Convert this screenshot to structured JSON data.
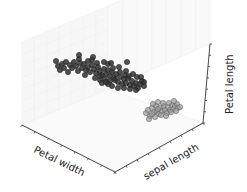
{
  "chart_data": {
    "type": "scatter",
    "projection": "3d",
    "title": "",
    "axes": {
      "x": {
        "label": "Petal width",
        "ticks_visible": true,
        "tick_labels": []
      },
      "y": {
        "label": "sepal length",
        "ticks_visible": true,
        "tick_labels": []
      },
      "z": {
        "label": "Petal length",
        "ticks_visible": true,
        "tick_labels": []
      }
    },
    "grid": true,
    "legend": null,
    "series": [
      {
        "name": "cluster-dark",
        "color": "#333333",
        "edge_color": "#222222",
        "alpha": 0.85,
        "count_estimate": 100,
        "screen_points": [
          [
            56,
            61
          ],
          [
            58,
            66
          ],
          [
            62,
            64
          ],
          [
            60,
            70
          ],
          [
            66,
            62
          ],
          [
            64,
            68
          ],
          [
            70,
            65
          ],
          [
            68,
            72
          ],
          [
            74,
            62
          ],
          [
            72,
            68
          ],
          [
            76,
            66
          ],
          [
            78,
            71
          ],
          [
            80,
            63
          ],
          [
            82,
            68
          ],
          [
            79,
            59
          ],
          [
            84,
            64
          ],
          [
            86,
            70
          ],
          [
            88,
            67
          ],
          [
            90,
            72
          ],
          [
            92,
            65
          ],
          [
            94,
            69
          ],
          [
            96,
            73
          ],
          [
            98,
            67
          ],
          [
            100,
            71
          ],
          [
            102,
            75
          ],
          [
            104,
            69
          ],
          [
            106,
            74
          ],
          [
            108,
            70
          ],
          [
            110,
            76
          ],
          [
            112,
            72
          ],
          [
            114,
            78
          ],
          [
            104,
            62
          ],
          [
            108,
            64
          ],
          [
            97,
            63
          ],
          [
            100,
            80
          ],
          [
            105,
            79
          ],
          [
            110,
            81
          ],
          [
            115,
            80
          ],
          [
            118,
            82
          ],
          [
            120,
            77
          ],
          [
            122,
            84
          ],
          [
            124,
            79
          ],
          [
            126,
            83
          ],
          [
            128,
            78
          ],
          [
            130,
            85
          ],
          [
            132,
            81
          ],
          [
            134,
            86
          ],
          [
            136,
            83
          ],
          [
            138,
            88
          ],
          [
            140,
            84
          ],
          [
            142,
            81
          ],
          [
            120,
            72
          ],
          [
            125,
            75
          ],
          [
            116,
            74
          ],
          [
            129,
            76
          ],
          [
            133,
            74
          ],
          [
            137,
            77
          ],
          [
            141,
            77
          ],
          [
            144,
            82
          ],
          [
            126,
            71
          ],
          [
            88,
            61
          ],
          [
            92,
            60
          ],
          [
            85,
            75
          ],
          [
            95,
            78
          ],
          [
            102,
            83
          ],
          [
            108,
            84
          ],
          [
            112,
            86
          ],
          [
            118,
            88
          ],
          [
            124,
            88
          ],
          [
            130,
            89
          ],
          [
            136,
            90
          ],
          [
            144,
            86
          ],
          [
            127,
            62
          ],
          [
            79,
            55
          ],
          [
            93,
            57
          ],
          [
            113,
            68
          ],
          [
            119,
            67
          ],
          [
            111,
            63
          ],
          [
            106,
            82
          ],
          [
            100,
            76
          ]
        ]
      },
      {
        "name": "cluster-light",
        "color": "#9a9a9a",
        "edge_color": "#666666",
        "alpha": 0.7,
        "count_estimate": 50,
        "screen_points": [
          [
            146,
            113
          ],
          [
            148,
            110
          ],
          [
            150,
            116
          ],
          [
            152,
            108
          ],
          [
            154,
            112
          ],
          [
            156,
            106
          ],
          [
            157,
            111
          ],
          [
            159,
            114
          ],
          [
            160,
            108
          ],
          [
            162,
            111
          ],
          [
            164,
            106
          ],
          [
            165,
            110
          ],
          [
            167,
            113
          ],
          [
            168,
            107
          ],
          [
            170,
            110
          ],
          [
            172,
            105
          ],
          [
            173,
            109
          ],
          [
            175,
            106
          ],
          [
            177,
            104
          ],
          [
            178,
            108
          ],
          [
            180,
            107
          ],
          [
            153,
            104
          ],
          [
            158,
            102
          ],
          [
            163,
            103
          ],
          [
            169,
            103
          ],
          [
            174,
            101
          ],
          [
            149,
            119
          ],
          [
            155,
            117
          ],
          [
            161,
            115
          ],
          [
            166,
            116
          ],
          [
            171,
            112
          ],
          [
            176,
            111
          ],
          [
            152,
            114
          ],
          [
            158,
            109
          ]
        ]
      }
    ]
  },
  "axis_labels": {
    "x": "Petal width",
    "y": "sepal length",
    "z": "Petal length"
  }
}
